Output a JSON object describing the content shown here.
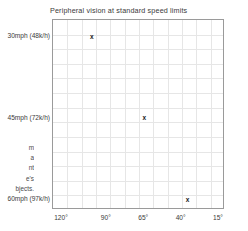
{
  "chart_data": {
    "type": "scatter",
    "title": "Peripheral vision at standard speed limits",
    "xlabel": "",
    "ylabel": "",
    "grid": true,
    "legend": false,
    "marker_symbol": "x",
    "x_ticks": [
      "120°",
      "90°",
      "65°",
      "40°",
      "15°"
    ],
    "x_tick_values": [
      120,
      90,
      65,
      40,
      15
    ],
    "y_ticks": [
      "30mph (48k/h)",
      "45mph (72k/h)",
      "60mph (97k/h)"
    ],
    "y_tick_values": [
      30,
      45,
      60
    ],
    "xlim": [
      126,
      11
    ],
    "ylim": [
      27,
      62
    ],
    "points": [
      {
        "x": 100,
        "y": 30,
        "x_label": "100°",
        "y_label": "30mph (48k/h)",
        "marker": "x"
      },
      {
        "x": 65,
        "y": 45,
        "x_label": "65°",
        "y_label": "45mph (72k/h)",
        "marker": "x"
      },
      {
        "x": 36,
        "y": 60,
        "x_label": "36°",
        "y_label": "60mph (97k/h)",
        "marker": "x"
      }
    ],
    "colors": {
      "marker": "#1a1a1a",
      "grid": "#e6e6e6",
      "frame": "#9a9a9a",
      "text": "#3a3a3a",
      "background": "#ffffff"
    }
  },
  "side_text": {
    "lines": [
      "m",
      "a",
      "nt",
      "e's",
      "bjects."
    ]
  }
}
